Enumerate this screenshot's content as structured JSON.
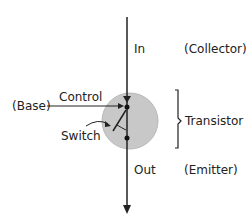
{
  "diagram": {
    "title": "",
    "labels": {
      "in": "In",
      "collector": "(Collector)",
      "control": "Control",
      "base": "(Base)",
      "switch": "Switch",
      "transistor": "Transistor",
      "out": "Out",
      "emitter": "(Emitter)"
    },
    "colors": {
      "line": "#222222",
      "circle_fill": "#c8c8c8",
      "circle_stroke": "#b0b0b0",
      "text": "#222222",
      "background": "#ffffff"
    }
  }
}
